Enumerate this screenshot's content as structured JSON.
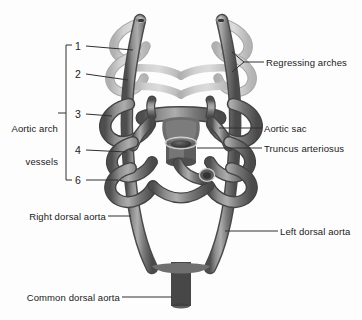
{
  "figure": {
    "type": "anatomical-diagram",
    "style": "grayscale airbrush illustration",
    "background_color": "#fdfdfd",
    "colors": {
      "vessel_active_dark": "#575757",
      "vessel_active_mid": "#7b7b7b",
      "vessel_active_light": "#a6a6a6",
      "vessel_regressing": "#c2c2c2",
      "vessel_regressing_edge": "#a8a8a8",
      "lumen_dark": "#3a3a3a",
      "leader_line": "#303030",
      "text": "#1a1a1a"
    }
  },
  "bracket_group": {
    "label_line1": "Aortic arch",
    "label_line2": "vessels",
    "arch_numbers": [
      "1",
      "2",
      "3",
      "4",
      "6"
    ]
  },
  "labels": {
    "regressing_arches": "Regressing arches",
    "aortic_sac": "Aortic sac",
    "truncus_arteriosus": "Truncus arteriosus",
    "right_dorsal_aorta": "Right dorsal aorta",
    "left_dorsal_aorta": "Left dorsal aorta",
    "common_dorsal_aorta": "Common dorsal aorta"
  },
  "structures": {
    "regressing": [
      "arch 1",
      "arch 2"
    ],
    "persisting": [
      "arch 3",
      "arch 4",
      "arch 6"
    ]
  }
}
